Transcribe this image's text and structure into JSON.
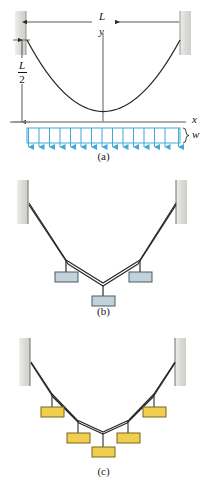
{
  "figure": {
    "panels": [
      {
        "id": "a",
        "caption": "(a)",
        "description": "Cable with uniformly distributed load",
        "labels": {
          "span": "L",
          "sag_numerator": "L",
          "sag_denominator": "2",
          "x_axis": "x",
          "y_axis": "y",
          "load": "w"
        },
        "load": {
          "type": "uniform-distributed",
          "arrow_count": 15,
          "color": "#3fa9d8"
        },
        "curve": "parabola"
      },
      {
        "id": "b",
        "caption": "(b)",
        "description": "Cable with three concentrated loads",
        "blocks": [
          {
            "label": "",
            "fill": "#c2d2da"
          },
          {
            "label": "",
            "fill": "#c2d2da"
          },
          {
            "label": "",
            "fill": "#c2d2da"
          }
        ]
      },
      {
        "id": "c",
        "caption": "(c)",
        "description": "Cable with five concentrated loads",
        "blocks": [
          {
            "label": "",
            "fill": "#f0cf4e"
          },
          {
            "label": "",
            "fill": "#f0cf4e"
          },
          {
            "label": "",
            "fill": "#f0cf4e"
          },
          {
            "label": "",
            "fill": "#f0cf4e"
          },
          {
            "label": "",
            "fill": "#f0cf4e"
          }
        ]
      }
    ],
    "colors": {
      "wall": "#d8d8d4",
      "cable": "#262626",
      "axis": "#8c8c8c",
      "load_blue": "#3fa9d8",
      "block_gray": "#c2d2da",
      "block_yellow": "#f0cf4e"
    }
  }
}
